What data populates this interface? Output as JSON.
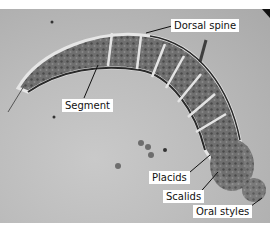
{
  "figure": {
    "colors": {
      "background": "#bdbdbd",
      "label_bg": "#ffffff",
      "label_text": "#111111",
      "leader": "#111111"
    },
    "labels": [
      {
        "id": "dorsal-spine",
        "text": "Dorsal spine"
      },
      {
        "id": "segment",
        "text": "Segment"
      },
      {
        "id": "placids",
        "text": "Placids"
      },
      {
        "id": "scalids",
        "text": "Scalids"
      },
      {
        "id": "oral-styles",
        "text": "Oral styles"
      }
    ]
  }
}
